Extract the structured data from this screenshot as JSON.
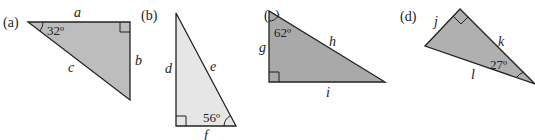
{
  "figure": {
    "triangles": [
      {
        "id": "a",
        "label": "(a)",
        "sides": [
          "a",
          "b",
          "c"
        ],
        "angle": "32º",
        "fill": "#bdbdbd"
      },
      {
        "id": "b",
        "label": "(b)",
        "sides": [
          "d",
          "e",
          "f"
        ],
        "angle": "56º",
        "fill": "#e6e6e6"
      },
      {
        "id": "c",
        "label": "(c)",
        "sides": [
          "g",
          "h",
          "i"
        ],
        "angle": "62º",
        "fill": "#a9a9a9"
      },
      {
        "id": "d",
        "label": "(d)",
        "sides": [
          "j",
          "k",
          "l"
        ],
        "angle": "27º",
        "fill": "#b0b0b0"
      }
    ],
    "stroke_color": "#222222"
  }
}
